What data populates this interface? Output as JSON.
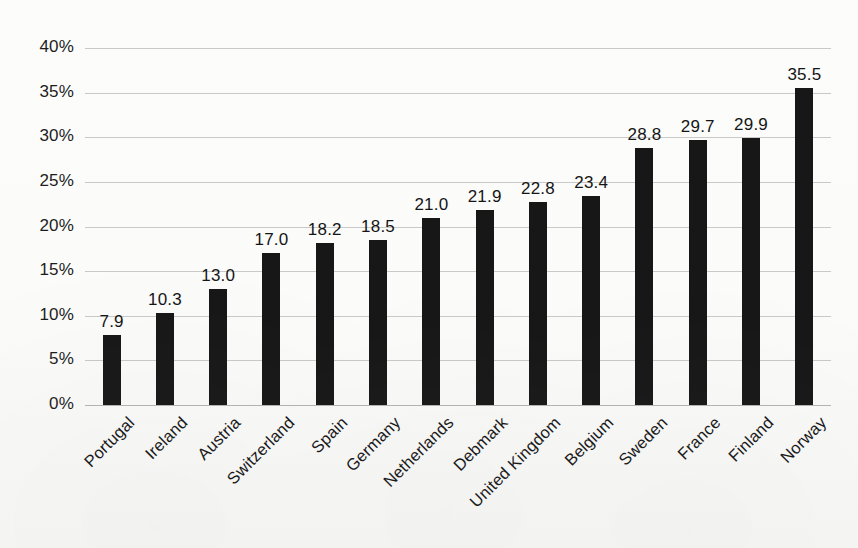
{
  "chart_data": {
    "type": "bar",
    "title": "",
    "subtitle": "",
    "xlabel": "",
    "ylabel": "",
    "ylim": [
      0,
      40
    ],
    "ytick_step": 5,
    "grid": true,
    "legend": null,
    "orientation": "vertical",
    "value_label_format": "one-decimal",
    "axis_tick_format": "percent",
    "bar_color": "#171717",
    "gridline_color": "#c9c9c9",
    "background_color": "#fbfbfa",
    "text_color": "#161616",
    "categories": [
      "Portugal",
      "Ireland",
      "Austria",
      "Switzerland",
      "Spain",
      "Germany",
      "Netherlands",
      "Debmark",
      "United Kingdom",
      "Belgium",
      "Sweden",
      "France",
      "Finland",
      "Norway"
    ],
    "values": [
      7.9,
      10.3,
      13.0,
      17.0,
      18.2,
      18.5,
      21.0,
      21.9,
      22.8,
      23.4,
      28.8,
      29.7,
      29.9,
      35.5
    ],
    "value_labels": [
      "7.9",
      "10.3",
      "13.0",
      "17.0",
      "18.2",
      "18.5",
      "21.0",
      "21.9",
      "22.8",
      "23.4",
      "28.8",
      "29.7",
      "29.9",
      "35.5"
    ],
    "ytick_labels": [
      "0%",
      "5%",
      "10%",
      "15%",
      "20%",
      "25%",
      "30%",
      "35%",
      "40%"
    ],
    "ytick_values": [
      0,
      5,
      10,
      15,
      20,
      25,
      30,
      35,
      40
    ]
  }
}
